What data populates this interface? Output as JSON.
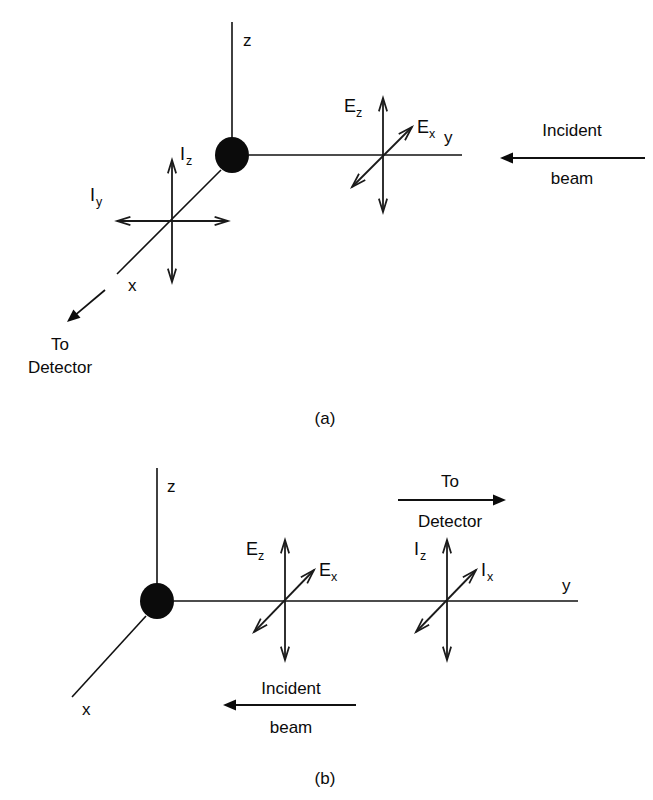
{
  "figure": {
    "background_color": "#ffffff",
    "ink_color": "#0b0b0b",
    "width": 653,
    "height": 800
  },
  "panels": [
    {
      "id": "a",
      "caption": "(a)",
      "caption_pos": {
        "x": 325,
        "y": 424
      },
      "scatterer": {
        "label": "scattering-particle",
        "cx": 232,
        "cy": 155,
        "rx": 17,
        "ry": 18
      },
      "axes": [
        {
          "name": "z",
          "label": "z",
          "label_pos": {
            "x": 243,
            "y": 46
          },
          "x1": 232,
          "y1": 22,
          "x2": 232,
          "y2": 140
        },
        {
          "name": "y",
          "label": "y",
          "label_pos": {
            "x": 444,
            "y": 143
          },
          "x1": 249,
          "y1": 155,
          "x2": 462,
          "y2": 155
        },
        {
          "name": "x",
          "label": "x",
          "label_pos": {
            "x": 128,
            "y": 291
          },
          "x1": 221,
          "y1": 170,
          "x2": 117,
          "y2": 274
        }
      ],
      "vector_crosses": [
        {
          "name": "incident-field-cross",
          "cx": 383,
          "cy": 158,
          "vertical": {
            "label": "E",
            "sub": "z",
            "label_pos": {
              "x": 344,
              "y": 112
            },
            "sub_pos": {
              "x": 356,
              "y": 117
            },
            "top": 98,
            "bottom": 212
          },
          "diagonal": {
            "label": "E",
            "sub": "x",
            "label_pos": {
              "x": 417,
              "y": 133
            },
            "sub_pos": {
              "x": 429,
              "y": 138
            },
            "x1": 352,
            "y1": 187,
            "x2": 412,
            "y2": 127
          }
        },
        {
          "name": "scattered-intensity-cross",
          "cx": 172,
          "cy": 221,
          "vertical": {
            "label": "I",
            "sub": "z",
            "label_pos": {
              "x": 180,
              "y": 160
            },
            "sub_pos": {
              "x": 186,
              "y": 165
            },
            "top": 160,
            "bottom": 282
          },
          "horizontal": {
            "label": "I",
            "sub": "y",
            "label_pos": {
              "x": 90,
              "y": 201
            },
            "sub_pos": {
              "x": 96,
              "y": 206
            },
            "left": 117,
            "right": 228
          }
        }
      ],
      "beams": [
        {
          "name": "incident-beam-arrow",
          "line1": "Incident",
          "line2": "beam",
          "direction": "left",
          "x1": 645,
          "y1": 158,
          "x2": 500,
          "y2": 158,
          "line1_pos": {
            "x": 572,
            "y": 136
          },
          "line2_pos": {
            "x": 572,
            "y": 184
          }
        },
        {
          "name": "to-detector-arrow",
          "line1": "To",
          "line2": "Detector",
          "direction": "down-left",
          "x1": 105,
          "y1": 290,
          "x2": 67,
          "y2": 322,
          "line1_pos": {
            "x": 60,
            "y": 350
          },
          "line2_pos": {
            "x": 60,
            "y": 373
          }
        }
      ]
    },
    {
      "id": "b",
      "caption": "(b)",
      "caption_pos": {
        "x": 325,
        "y": 784
      },
      "scatterer": {
        "label": "scattering-particle",
        "cx": 157,
        "cy": 601,
        "rx": 17,
        "ry": 18
      },
      "axes": [
        {
          "name": "z",
          "label": "z",
          "label_pos": {
            "x": 167,
            "y": 492
          },
          "x1": 157,
          "y1": 468,
          "x2": 157,
          "y2": 586
        },
        {
          "name": "y",
          "label": "y",
          "label_pos": {
            "x": 562,
            "y": 591
          },
          "x1": 174,
          "y1": 601,
          "x2": 578,
          "y2": 601
        },
        {
          "name": "x",
          "label": "x",
          "label_pos": {
            "x": 82,
            "y": 715
          },
          "x1": 146,
          "y1": 616,
          "x2": 72,
          "y2": 697
        }
      ],
      "vector_crosses": [
        {
          "name": "incident-field-cross",
          "cx": 285,
          "cy": 601,
          "vertical": {
            "label": "E",
            "sub": "z",
            "label_pos": {
              "x": 246,
              "y": 555
            },
            "sub_pos": {
              "x": 258,
              "y": 560
            },
            "top": 540,
            "bottom": 660
          },
          "diagonal": {
            "label": "E",
            "sub": "x",
            "label_pos": {
              "x": 319,
              "y": 576
            },
            "sub_pos": {
              "x": 331,
              "y": 581
            },
            "x1": 254,
            "y1": 632,
            "x2": 314,
            "y2": 570
          }
        },
        {
          "name": "scattered-intensity-cross",
          "cx": 447,
          "cy": 601,
          "vertical": {
            "label": "I",
            "sub": "z",
            "label_pos": {
              "x": 414,
              "y": 555
            },
            "sub_pos": {
              "x": 420,
              "y": 560
            },
            "top": 540,
            "bottom": 660
          },
          "diagonal": {
            "label": "I",
            "sub": "x",
            "label_pos": {
              "x": 481,
              "y": 576
            },
            "sub_pos": {
              "x": 487,
              "y": 581
            },
            "x1": 416,
            "y1": 632,
            "x2": 476,
            "y2": 570
          }
        }
      ],
      "beams": [
        {
          "name": "to-detector-arrow",
          "line1": "To",
          "line2": "Detector",
          "direction": "right",
          "x1": 398,
          "y1": 500,
          "x2": 506,
          "y2": 500,
          "line1_pos": {
            "x": 450,
            "y": 487
          },
          "line2_pos": {
            "x": 450,
            "y": 527
          }
        },
        {
          "name": "incident-beam-arrow",
          "line1": "Incident",
          "line2": "beam",
          "direction": "left",
          "x1": 356,
          "y1": 705,
          "x2": 223,
          "y2": 705,
          "line1_pos": {
            "x": 291,
            "y": 694
          },
          "line2_pos": {
            "x": 291,
            "y": 733
          }
        }
      ]
    }
  ]
}
